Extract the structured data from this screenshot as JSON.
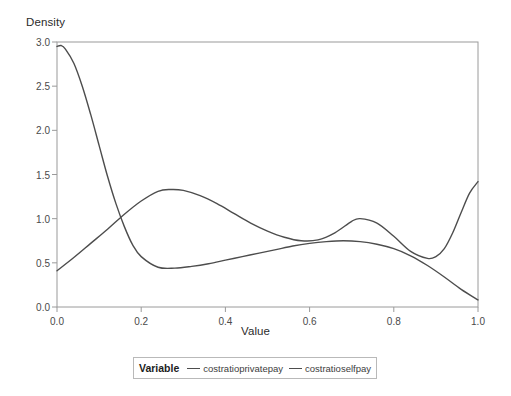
{
  "chart_data": {
    "type": "line",
    "title": "",
    "xlabel": "Value",
    "ylabel": "Density",
    "xlim": [
      0.0,
      1.0
    ],
    "ylim": [
      0.0,
      3.0
    ],
    "grid": false,
    "legend_position": "bottom",
    "legend_title": "Variable",
    "x_ticks": [
      "0.0",
      "0.2",
      "0.4",
      "0.6",
      "0.8",
      "1.0"
    ],
    "x_tick_values": [
      0.0,
      0.2,
      0.4,
      0.6,
      0.8,
      1.0
    ],
    "y_ticks": [
      "0.0",
      "0.5",
      "1.0",
      "1.5",
      "2.0",
      "2.5",
      "3.0"
    ],
    "y_tick_values": [
      0.0,
      0.5,
      1.0,
      1.5,
      2.0,
      2.5,
      3.0
    ],
    "series": [
      {
        "name": "costratioprivatepay",
        "color": "#4d4d4d",
        "x": [
          0.0,
          0.01,
          0.02,
          0.04,
          0.06,
          0.08,
          0.1,
          0.12,
          0.14,
          0.16,
          0.18,
          0.2,
          0.24,
          0.28,
          0.32,
          0.36,
          0.4,
          0.44,
          0.48,
          0.52,
          0.56,
          0.6,
          0.64,
          0.68,
          0.72,
          0.76,
          0.8,
          0.84,
          0.88,
          0.92,
          0.96,
          1.0
        ],
        "y": [
          2.95,
          2.96,
          2.92,
          2.76,
          2.5,
          2.18,
          1.83,
          1.48,
          1.17,
          0.91,
          0.7,
          0.57,
          0.45,
          0.44,
          0.46,
          0.49,
          0.53,
          0.57,
          0.61,
          0.65,
          0.69,
          0.72,
          0.74,
          0.75,
          0.74,
          0.71,
          0.66,
          0.58,
          0.47,
          0.34,
          0.2,
          0.08
        ]
      },
      {
        "name": "costratioselfpay",
        "color": "#4d4d4d",
        "x": [
          0.0,
          0.04,
          0.08,
          0.12,
          0.16,
          0.2,
          0.24,
          0.27,
          0.3,
          0.34,
          0.38,
          0.42,
          0.46,
          0.5,
          0.54,
          0.58,
          0.62,
          0.66,
          0.7,
          0.72,
          0.76,
          0.8,
          0.84,
          0.88,
          0.9,
          0.92,
          0.94,
          0.96,
          0.98,
          1.0
        ],
        "y": [
          0.41,
          0.56,
          0.72,
          0.88,
          1.05,
          1.2,
          1.31,
          1.33,
          1.32,
          1.26,
          1.17,
          1.06,
          0.95,
          0.86,
          0.79,
          0.75,
          0.76,
          0.84,
          0.97,
          1.0,
          0.95,
          0.8,
          0.63,
          0.55,
          0.57,
          0.66,
          0.84,
          1.07,
          1.29,
          1.42
        ]
      }
    ]
  },
  "axes": {
    "y_title": "Density",
    "x_title": "Value"
  },
  "legend": {
    "title": "Variable",
    "entries": [
      {
        "label": "costratioprivatepay"
      },
      {
        "label": "costratioselfpay"
      }
    ]
  }
}
